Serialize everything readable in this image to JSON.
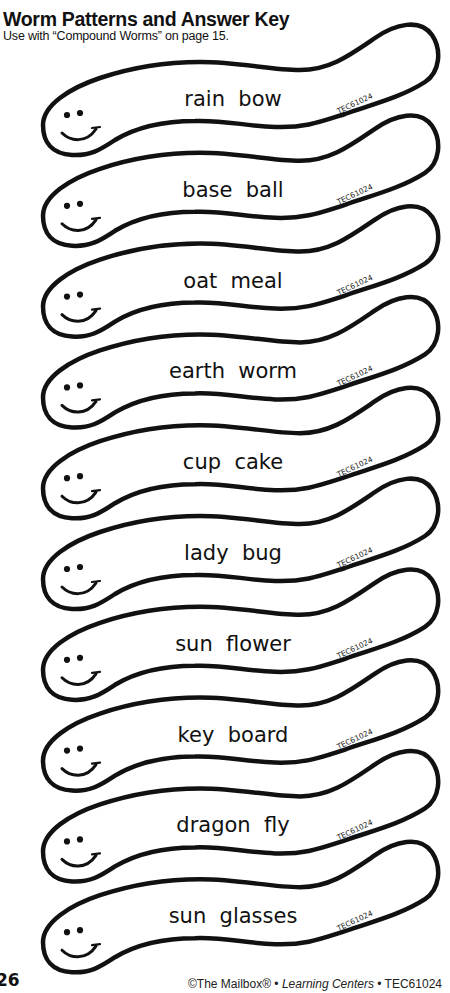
{
  "header": {
    "title": "Worm Patterns and Answer Key",
    "subtitle": "Use with “Compound Worms” on page 15."
  },
  "worm_code": "TEC61024",
  "worms": [
    {
      "word": "rain  bow"
    },
    {
      "word": "base  ball"
    },
    {
      "word": "oat  meal"
    },
    {
      "word": "earth  worm"
    },
    {
      "word": "cup  cake"
    },
    {
      "word": "lady  bug"
    },
    {
      "word": "sun  flower"
    },
    {
      "word": "key  board"
    },
    {
      "word": "dragon  fly"
    },
    {
      "word": "sun  glasses"
    }
  ],
  "footer": {
    "page_number": "26",
    "copyright": "©The Mailbox® • ",
    "publication": "Learning Centers",
    "code": " • TEC61024"
  },
  "colors": {
    "ink": "#111111",
    "paper": "#ffffff"
  }
}
